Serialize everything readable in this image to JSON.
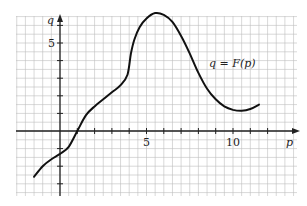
{
  "chart_data": {
    "type": "line",
    "title": "",
    "xlabel": "p",
    "ylabel": "q",
    "xlim": [
      -1.6,
      13.4
    ],
    "ylim": [
      -3.7,
      6.8
    ],
    "grid": true,
    "grid_step": 0.5,
    "x_ticks": [
      1,
      2,
      3,
      4,
      5,
      6,
      7,
      8,
      9,
      10,
      11,
      12
    ],
    "x_tick_labels": [
      {
        "value": 5,
        "label": "5"
      },
      {
        "value": 10,
        "label": "10"
      }
    ],
    "y_ticks": [
      -3,
      -2,
      -1,
      1,
      2,
      3,
      4,
      5,
      6
    ],
    "y_tick_labels": [
      {
        "value": 5,
        "label": "5"
      }
    ],
    "series": [
      {
        "name": "q = F(p)",
        "x": [
          -1.5,
          -1.0,
          -0.5,
          0.0,
          0.5,
          1.0,
          1.5,
          2.0,
          2.5,
          3.0,
          3.5,
          3.9,
          4.1,
          4.3,
          4.6,
          5.0,
          5.5,
          6.0,
          6.5,
          7.0,
          7.5,
          8.0,
          8.5,
          9.0,
          9.5,
          10.0,
          10.5,
          11.0,
          11.5
        ],
        "y": [
          -2.6,
          -2.0,
          -1.6,
          -1.3,
          -0.9,
          0.0,
          0.9,
          1.4,
          1.8,
          2.2,
          2.6,
          3.2,
          4.4,
          5.2,
          5.9,
          6.4,
          6.7,
          6.6,
          6.2,
          5.4,
          4.4,
          3.3,
          2.4,
          1.8,
          1.4,
          1.2,
          1.15,
          1.25,
          1.5
        ]
      }
    ],
    "annotations": [
      {
        "text": "q = F(p)",
        "x": 8.9,
        "y": 3.6
      }
    ]
  },
  "labels": {
    "x_axis": "p",
    "y_axis": "q",
    "x_tick_5": "5",
    "x_tick_10": "10",
    "y_tick_5": "5",
    "curve": "q = F(p)"
  }
}
